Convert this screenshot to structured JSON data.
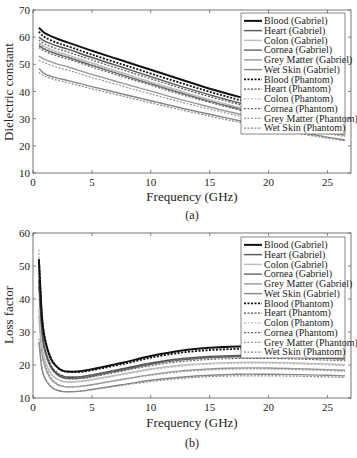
{
  "figure": {
    "panel_a_caption": "(a)",
    "panel_b_caption": "(b)"
  },
  "chart_data": [
    {
      "type": "line",
      "panel": "(a)",
      "title": "",
      "xlabel": "Frequency (GHz)",
      "ylabel": "Dielectric constant",
      "xlim": [
        0,
        27
      ],
      "ylim": [
        10,
        70
      ],
      "xticks": [
        0,
        5,
        10,
        15,
        20,
        25
      ],
      "yticks": [
        10,
        20,
        30,
        40,
        50,
        60,
        70
      ],
      "grid": false,
      "legend_position": "upper right",
      "x": [
        0.5,
        1,
        2,
        3,
        5,
        7.5,
        10,
        12.5,
        15,
        17.5,
        20,
        22.5,
        25,
        26.5
      ],
      "series": [
        {
          "name": "Blood (Gabriel)",
          "color": "#111111",
          "width": 2.0,
          "dash": "",
          "values": [
            63.5,
            61.5,
            59.5,
            58,
            55,
            51.5,
            48,
            44.5,
            41,
            38,
            35,
            32,
            29.5,
            28
          ]
        },
        {
          "name": "Heart (Gabriel)",
          "color": "#555555",
          "width": 1.4,
          "dash": "",
          "values": [
            60,
            58.5,
            56.8,
            55.5,
            52.5,
            49,
            45.5,
            42,
            38.8,
            35.8,
            33,
            30.5,
            28,
            26.8
          ]
        },
        {
          "name": "Colon (Gabriel)",
          "color": "#bbbbbb",
          "width": 1.4,
          "dash": "",
          "values": [
            58,
            56.5,
            54.7,
            53.4,
            50.5,
            47,
            43.5,
            40.2,
            37,
            34.2,
            31.6,
            29.2,
            26.9,
            25.7
          ]
        },
        {
          "name": "Cornea (Gabriel)",
          "color": "#666666",
          "width": 1.4,
          "dash": "",
          "values": [
            57,
            55.5,
            53.8,
            52.5,
            49.6,
            46.2,
            42.8,
            39.5,
            36.4,
            33.6,
            31,
            28.6,
            26.4,
            25.2
          ]
        },
        {
          "name": "Grey Matter (Gabriel)",
          "color": "#999999",
          "width": 1.4,
          "dash": "",
          "values": [
            53,
            51.8,
            50.2,
            49,
            46.3,
            43.2,
            40.1,
            37.1,
            34.3,
            31.7,
            29.3,
            27.1,
            25,
            23.9
          ]
        },
        {
          "name": "Wet Skin (Gabriel)",
          "color": "#888888",
          "width": 1.4,
          "dash": "",
          "values": [
            48.5,
            46.5,
            45,
            44,
            41.8,
            39.2,
            36.6,
            34,
            31.6,
            29.3,
            27.1,
            25.1,
            23.2,
            22.2
          ]
        },
        {
          "name": "Blood (Phantom)",
          "color": "#111111",
          "width": 1.8,
          "dash": "2,1.5",
          "values": [
            62,
            60,
            58,
            56.6,
            53.6,
            50.1,
            46.6,
            43.2,
            39.9,
            36.9,
            34,
            31.3,
            28.8,
            27.4
          ]
        },
        {
          "name": "Heart (Phantom)",
          "color": "#555555",
          "width": 1.2,
          "dash": "2,1.5",
          "values": [
            59,
            57.5,
            55.8,
            54.5,
            51.6,
            48.1,
            44.7,
            41.3,
            38.1,
            35.2,
            32.4,
            29.9,
            27.5,
            26.3
          ]
        },
        {
          "name": "Colon (Phantom)",
          "color": "#bbbbbb",
          "width": 1.2,
          "dash": "2,1.5",
          "values": [
            57.5,
            56,
            54.2,
            53,
            50,
            46.6,
            43.2,
            39.9,
            36.8,
            34,
            31.3,
            28.9,
            26.6,
            25.4
          ]
        },
        {
          "name": "Cornea (Phantom)",
          "color": "#666666",
          "width": 1.2,
          "dash": "2,1.5",
          "values": [
            56.2,
            54.8,
            53.1,
            51.9,
            49,
            45.6,
            42.3,
            39,
            36,
            33.2,
            30.6,
            28.3,
            26.1,
            24.9
          ]
        },
        {
          "name": "Grey Matter (Phantom)",
          "color": "#999999",
          "width": 1.2,
          "dash": "2,1.5",
          "values": [
            51.5,
            50.5,
            49,
            47.8,
            45.2,
            42.1,
            39.1,
            36.2,
            33.5,
            31,
            28.7,
            26.5,
            24.5,
            23.4
          ]
        },
        {
          "name": "Wet Skin (Phantom)",
          "color": "#888888",
          "width": 1.2,
          "dash": "2,1.5",
          "values": [
            47,
            45.6,
            44.2,
            43.2,
            41,
            38.4,
            35.8,
            33.3,
            30.9,
            28.7,
            26.6,
            24.6,
            22.8,
            21.8
          ]
        }
      ]
    },
    {
      "type": "line",
      "panel": "(b)",
      "title": "",
      "xlabel": "Frequency (GHz)",
      "ylabel": "Loss factor",
      "xlim": [
        0,
        27
      ],
      "ylim": [
        10,
        60
      ],
      "xticks": [
        0,
        5,
        10,
        15,
        20,
        25
      ],
      "yticks": [
        10,
        20,
        30,
        40,
        50,
        60
      ],
      "grid": false,
      "legend_position": "upper right",
      "x": [
        0.5,
        0.75,
        1,
        1.5,
        2,
        2.5,
        3,
        4,
        5,
        7.5,
        10,
        12.5,
        15,
        17.5,
        20,
        22.5,
        25,
        26.5
      ],
      "series": [
        {
          "name": "Blood (Gabriel)",
          "color": "#111111",
          "width": 2.0,
          "dash": "",
          "values": [
            52,
            35,
            28,
            22,
            19.5,
            18.3,
            18,
            18.1,
            18.7,
            20.6,
            22.7,
            24.3,
            25.2,
            25.6,
            25.7,
            25.5,
            25.2,
            25
          ]
        },
        {
          "name": "Heart (Gabriel)",
          "color": "#555555",
          "width": 1.4,
          "dash": "",
          "values": [
            46,
            31,
            25,
            19.8,
            17.6,
            16.6,
            16.3,
            16.4,
            17,
            18.8,
            20.6,
            21.9,
            22.6,
            22.9,
            22.9,
            22.7,
            22.4,
            22.2
          ]
        },
        {
          "name": "Colon (Gabriel)",
          "color": "#bbbbbb",
          "width": 1.4,
          "dash": "",
          "values": [
            37,
            26,
            21.5,
            17.5,
            15.8,
            15.1,
            14.9,
            15.1,
            15.6,
            17.2,
            18.8,
            19.9,
            20.5,
            20.8,
            20.8,
            20.6,
            20.3,
            20.1
          ]
        },
        {
          "name": "Cornea (Gabriel)",
          "color": "#666666",
          "width": 1.4,
          "dash": "",
          "values": [
            44,
            30,
            24.2,
            19.3,
            17.2,
            16.2,
            15.9,
            16,
            16.6,
            18.4,
            20.2,
            21.5,
            22.2,
            22.5,
            22.5,
            22.3,
            22,
            21.8
          ]
        },
        {
          "name": "Grey Matter (Gabriel)",
          "color": "#999999",
          "width": 1.4,
          "dash": "",
          "values": [
            35,
            24,
            19.6,
            15.8,
            14.2,
            13.5,
            13.3,
            13.5,
            14,
            15.6,
            17.1,
            18.2,
            18.8,
            19.1,
            19.1,
            18.9,
            18.6,
            18.4
          ]
        },
        {
          "name": "Wet Skin (Gabriel)",
          "color": "#888888",
          "width": 1.4,
          "dash": "",
          "values": [
            27,
            19,
            16,
            13.5,
            12.4,
            12,
            11.9,
            12.1,
            12.6,
            14,
            15.4,
            16.3,
            16.9,
            17.2,
            17.2,
            17.1,
            16.9,
            16.7
          ]
        },
        {
          "name": "Blood (Phantom)",
          "color": "#111111",
          "width": 1.8,
          "dash": "2,1.5",
          "values": [
            52,
            35.5,
            28.2,
            22.2,
            19.6,
            18.3,
            17.9,
            17.9,
            18.4,
            20.2,
            22.2,
            23.7,
            24.5,
            24.9,
            25,
            24.8,
            24.5,
            24.3
          ]
        },
        {
          "name": "Heart (Phantom)",
          "color": "#555555",
          "width": 1.2,
          "dash": "2,1.5",
          "values": [
            48,
            32,
            25.5,
            20.2,
            17.9,
            16.8,
            16.4,
            16.5,
            17,
            18.7,
            20.4,
            21.7,
            22.4,
            22.7,
            22.7,
            22.5,
            22.2,
            22
          ]
        },
        {
          "name": "Colon (Phantom)",
          "color": "#bbbbbb",
          "width": 1.2,
          "dash": "2,1.5",
          "values": [
            40,
            27.5,
            22,
            17.8,
            15.9,
            15.1,
            14.8,
            14.9,
            15.4,
            17,
            18.5,
            19.6,
            20.2,
            20.5,
            20.5,
            20.3,
            20,
            19.8
          ]
        },
        {
          "name": "Cornea (Phantom)",
          "color": "#666666",
          "width": 1.2,
          "dash": "2,1.5",
          "values": [
            45,
            30.5,
            24.4,
            19.4,
            17.2,
            16.2,
            15.8,
            15.9,
            16.4,
            18.1,
            19.8,
            21,
            21.7,
            22,
            22,
            21.8,
            21.5,
            21.3
          ]
        },
        {
          "name": "Grey Matter (Phantom)",
          "color": "#999999",
          "width": 1.2,
          "dash": "2,1.5",
          "values": [
            55,
            26,
            20.5,
            16.3,
            14.5,
            13.7,
            13.4,
            13.5,
            14,
            15.5,
            16.9,
            17.9,
            18.5,
            18.8,
            18.8,
            18.6,
            18.3,
            18.1
          ]
        },
        {
          "name": "Wet Skin (Phantom)",
          "color": "#888888",
          "width": 1.2,
          "dash": "2,1.5",
          "values": [
            28,
            19.5,
            16.2,
            13.6,
            12.5,
            12,
            11.9,
            12,
            12.5,
            13.8,
            15,
            15.9,
            16.5,
            16.7,
            16.7,
            16.6,
            16.4,
            16.2
          ]
        }
      ]
    }
  ]
}
